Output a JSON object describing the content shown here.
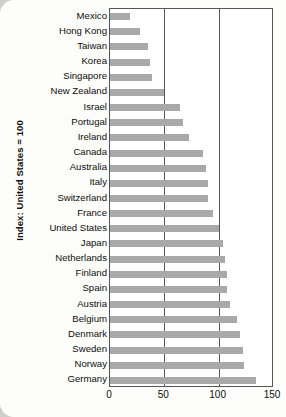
{
  "chart_data": {
    "type": "bar",
    "orientation": "horizontal",
    "title": "",
    "xlabel": "",
    "ylabel": "Index: United States = 100",
    "xlim": [
      0,
      150
    ],
    "xticks": [
      0,
      50,
      100,
      150
    ],
    "grid": true,
    "gridlines_at": [
      0,
      50,
      100,
      150
    ],
    "legend": null,
    "bar_color": "#a9a9a9",
    "plot_background": "#ffffff",
    "axis_color": "#55565a",
    "categories": [
      "Mexico",
      "Hong Kong",
      "Taiwan",
      "Korea",
      "Singapore",
      "New Zealand",
      "Israel",
      "Portugal",
      "Ireland",
      "Canada",
      "Australia",
      "Italy",
      "Switzerland",
      "France",
      "United States",
      "Japan",
      "Netherlands",
      "Finland",
      "Spain",
      "Austria",
      "Belgium",
      "Denmark",
      "Sweden",
      "Norway",
      "Germany"
    ],
    "values": [
      18,
      28,
      35,
      37,
      39,
      50,
      64,
      67,
      73,
      86,
      88,
      90,
      90,
      95,
      100,
      104,
      106,
      108,
      108,
      110,
      117,
      120,
      122,
      123,
      134
    ]
  }
}
